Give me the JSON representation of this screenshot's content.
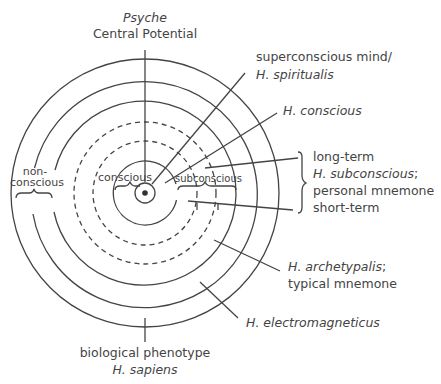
{
  "diagram": {
    "title_top": {
      "line1": "Psyche",
      "line2": "Central Potential"
    },
    "labels": {
      "superconscious": {
        "line1": "superconscious mind/",
        "line2": "H. spiritualis"
      },
      "h_conscious": "H. conscious",
      "subconscious_group": {
        "long_term": "long-term",
        "h_subconscious": "H. subconscious",
        "h_subconscious_suffix": ";",
        "personal_mnemone": "personal mnemone",
        "short_term": "short-term"
      },
      "archetypalis": {
        "line1": "H. archetypalis",
        "line1_suffix": ";",
        "line2": "typical mnemone"
      },
      "electromagneticus": "H. electromagneticus",
      "bottom": {
        "line1": "biological phenotype",
        "line2": "H. sapiens"
      },
      "non_conscious": {
        "line1": "non-",
        "line2": "conscious"
      },
      "conscious": "conscious",
      "subconscious": "subconscious"
    },
    "colors": {
      "stroke": "#444444",
      "text": "#444444",
      "background": "#ffffff"
    }
  }
}
